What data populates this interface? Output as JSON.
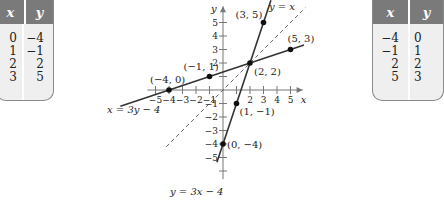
{
  "left_table": {
    "headers": [
      "x",
      "y"
    ],
    "x": [
      "0",
      "1",
      "2",
      "3"
    ],
    "y": [
      "−4",
      "−1",
      "2",
      "5"
    ]
  },
  "right_table": {
    "headers": [
      "x",
      "y"
    ],
    "x": [
      "−4",
      "−1",
      "2",
      "5"
    ],
    "y": [
      "0",
      "1",
      "2",
      "3"
    ]
  },
  "chart_data": {
    "type": "line",
    "title": "",
    "xlabel": "x",
    "ylabel": "y",
    "xlim": [
      -5,
      5
    ],
    "ylim": [
      -5,
      5
    ],
    "x_ticks": [
      "−5",
      "−4",
      "−3",
      "−2",
      "−1",
      "2",
      "3",
      "4",
      "5"
    ],
    "y_ticks": [
      "5",
      "4",
      "3",
      "2",
      "−1",
      "−2",
      "−3",
      "−4",
      "−5"
    ],
    "grid": false,
    "series": [
      {
        "name": "y = 3x − 4",
        "style": "solid",
        "points": [
          [
            0,
            -4
          ],
          [
            1,
            -1
          ],
          [
            2,
            2
          ],
          [
            3,
            5
          ]
        ],
        "point_labels": [
          "(0, −4)",
          "(1, −1)",
          "(2, 2)",
          "(3, 5)"
        ]
      },
      {
        "name": "x = 3y − 4",
        "style": "solid",
        "points": [
          [
            -4,
            0
          ],
          [
            -1,
            1
          ],
          [
            2,
            2
          ],
          [
            5,
            3
          ]
        ],
        "point_labels": [
          "(−4, 0)",
          "(−1, 1)",
          "",
          "(5, 3)"
        ]
      },
      {
        "name": "y = x",
        "style": "dashed",
        "points": [
          [
            -4,
            -4
          ],
          [
            6,
            6
          ]
        ]
      }
    ],
    "annotations": [
      "y = 3x − 4",
      "x = 3y − 4",
      "y = x",
      "(3, 5)",
      "(5, 3)",
      "(2, 2)",
      "(−1, 1)",
      "(−4, 0)",
      "(1, −1)",
      "(0, −4)"
    ]
  }
}
